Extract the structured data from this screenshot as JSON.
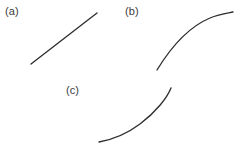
{
  "figure": {
    "width": 235,
    "height": 155,
    "background_color": "#ffffff",
    "stroke_color": "#2e2e30",
    "label_color": "#3b3b3b",
    "stroke_width": 1.35
  },
  "panels": [
    {
      "id": "a",
      "label": "(a)",
      "shape": "straight-line",
      "description": "linear increasing line",
      "path": "M 31 64 L 97 13"
    },
    {
      "id": "b",
      "label": "(b)",
      "shape": "concave-down-curve",
      "description": "increasing curve, concave down, flattening to the right",
      "path": "M 157 70 C 168 52, 186 28, 210 18 C 219 14, 228 13, 233 12"
    },
    {
      "id": "c",
      "label": "(c)",
      "shape": "concave-up-curve",
      "description": "increasing curve, concave up, steepening to the right",
      "path": "M 99 142 C 110 140, 124 136, 140 124 C 156 112, 167 98, 171 88"
    }
  ],
  "chart_data": {
    "type": "line",
    "title": "",
    "xlabel": "",
    "ylabel": "",
    "grid": false,
    "legend": null,
    "subplots": [
      {
        "name": "(a)",
        "curve_type": "linear",
        "x": [
          31,
          44,
          58,
          71,
          84,
          97
        ],
        "y": [
          64,
          54,
          44,
          33,
          23,
          13
        ],
        "xlim": [
          31,
          97
        ],
        "ylim": [
          13,
          64
        ]
      },
      {
        "name": "(b)",
        "curve_type": "concave-down",
        "x": [
          157,
          172,
          187,
          202,
          217,
          233
        ],
        "y": [
          70,
          51,
          37,
          25,
          17,
          12
        ],
        "xlim": [
          157,
          233
        ],
        "ylim": [
          12,
          70
        ]
      },
      {
        "name": "(c)",
        "curve_type": "concave-up",
        "x": [
          99,
          113,
          128,
          142,
          157,
          171
        ],
        "y": [
          142,
          139,
          133,
          123,
          107,
          88
        ],
        "xlim": [
          99,
          171
        ],
        "ylim": [
          88,
          142
        ]
      }
    ]
  }
}
